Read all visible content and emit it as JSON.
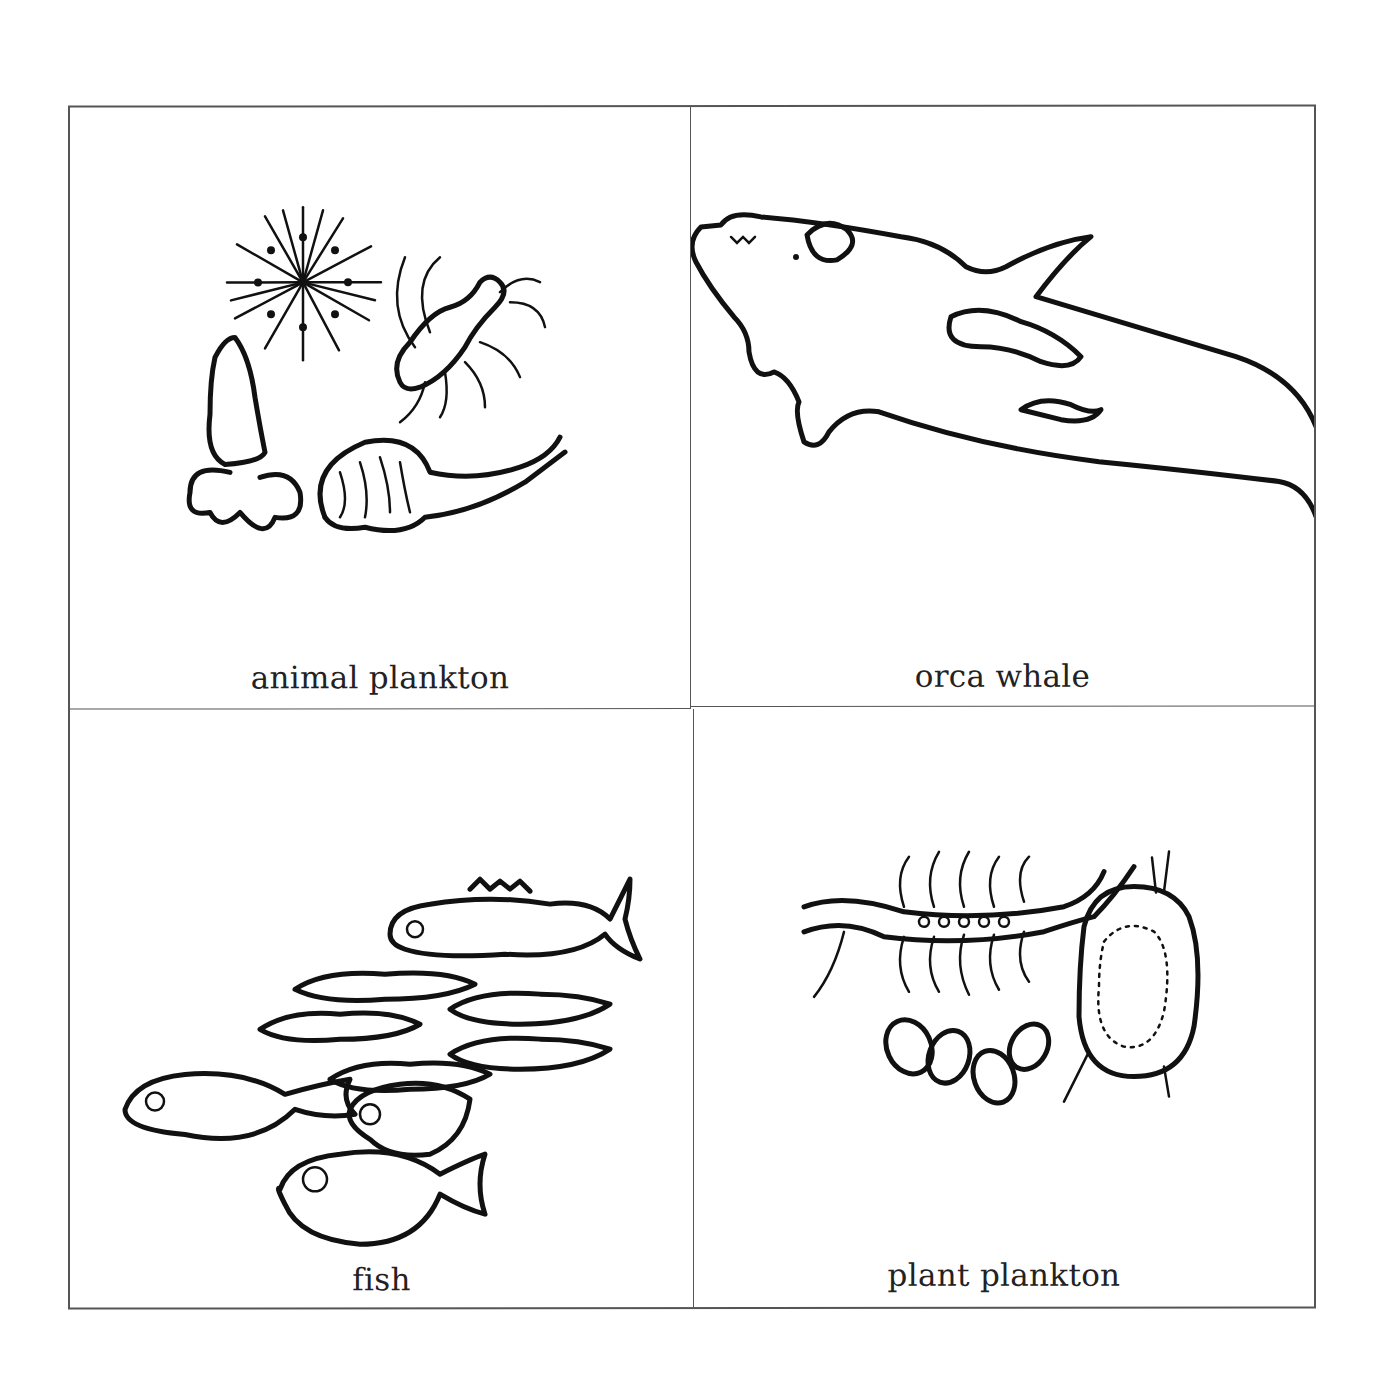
{
  "panels": [
    {
      "id": "animal-plankton",
      "label": "animal plankton",
      "icon": "animal-plankton-illustration"
    },
    {
      "id": "orca-whale",
      "label": "orca whale",
      "icon": "orca-whale-illustration"
    },
    {
      "id": "fish",
      "label": "fish",
      "icon": "fish-school-illustration"
    },
    {
      "id": "plant-plankton",
      "label": "plant plankton",
      "icon": "plant-plankton-illustration"
    }
  ],
  "colors": {
    "border": "#555555",
    "ink": "#111111",
    "background": "#ffffff"
  }
}
